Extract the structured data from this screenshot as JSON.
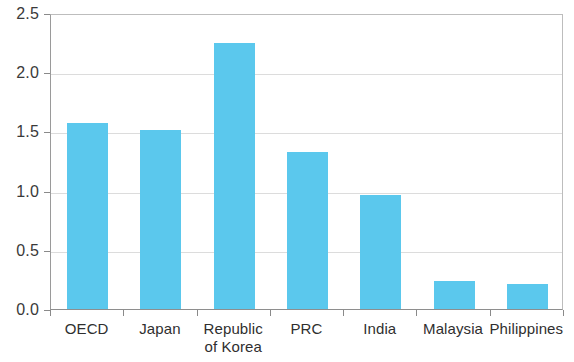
{
  "chart_data": {
    "type": "bar",
    "title": "",
    "subtitle": "",
    "xlabel": "",
    "ylabel": "",
    "categories": [
      "OECD",
      "Japan",
      "Republic\nof Korea",
      "PRC",
      "India",
      "Malaysia",
      "Philippines"
    ],
    "values": [
      1.57,
      1.51,
      2.25,
      1.33,
      0.96,
      0.24,
      0.21
    ],
    "ylim": [
      0.0,
      2.5
    ],
    "ytick_labels": [
      "0.0",
      "0.5",
      "1.0",
      "1.5",
      "2.0",
      "2.5"
    ],
    "ytick_values": [
      0.0,
      0.5,
      1.0,
      1.5,
      2.0,
      2.5
    ],
    "grid": true,
    "legend": null,
    "bar_color": "#5BC8ED",
    "grid_color": "#dcdcdc",
    "axis_color": "#8a8a8a"
  }
}
